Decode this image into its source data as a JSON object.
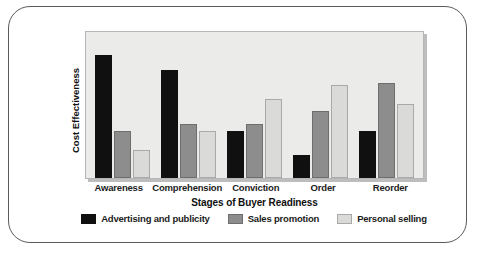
{
  "chart_data": {
    "type": "bar",
    "title": "",
    "xlabel": "Stages of Buyer Readiness",
    "ylabel": "Cost Effectiveness",
    "categories": [
      "Awareness",
      "Comprehension",
      "Conviction",
      "Order",
      "Reorder"
    ],
    "series": [
      {
        "name": "Advertising and publicity",
        "color": "#101010",
        "values": [
          84,
          74,
          32,
          16,
          32
        ]
      },
      {
        "name": "Sales promotion",
        "color": "#8d8d8d",
        "values": [
          32,
          37,
          37,
          46,
          65
        ]
      },
      {
        "name": "Personal selling",
        "color": "#dadad8",
        "values": [
          19,
          32,
          54,
          64,
          51
        ]
      }
    ],
    "ylim": [
      0,
      100
    ],
    "grid": false,
    "legend_position": "bottom",
    "axis_ticks_shown": false,
    "plot_background": "#ebebe9"
  },
  "legend": {
    "items": [
      {
        "label": "Advertising and publicity"
      },
      {
        "label": "Sales promotion"
      },
      {
        "label": "Personal selling"
      }
    ]
  }
}
